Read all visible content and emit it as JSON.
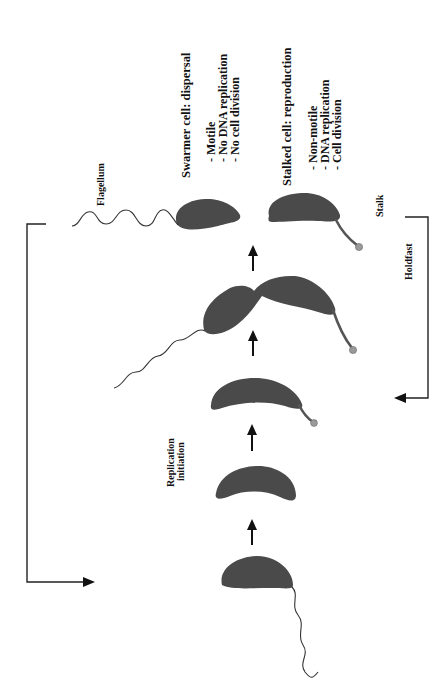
{
  "figure": {
    "orientation": "rotated 90 degrees counter-clockwise"
  },
  "labels": {
    "swarmer_title": "Swarmer cell: dispersal",
    "swarmer_items": [
      "- Motile",
      "- No DNA replication",
      "- No cell division"
    ],
    "stalked_title": "Stalked cell: reproduction",
    "stalked_items": [
      "- Non-motile",
      "- DNA replication",
      "- Cell division"
    ],
    "flagellum": "Flagellum",
    "stalk": "Stalk",
    "holdfast": "Holdfast",
    "replication_line1": "Replication",
    "replication_line2": "initiation"
  },
  "stages": [
    {
      "name": "swarmer cell",
      "features": [
        "flagellum"
      ]
    },
    {
      "name": "stalked cell (replication initiation)",
      "features": []
    },
    {
      "name": "stalked cell",
      "features": [
        "stalk",
        "holdfast"
      ]
    },
    {
      "name": "predivisional cell",
      "features": [
        "flagellum",
        "stalk",
        "holdfast"
      ]
    },
    {
      "name": "daughter swarmer cell",
      "features": [
        "flagellum"
      ]
    },
    {
      "name": "daughter stalked cell",
      "features": [
        "stalk",
        "holdfast"
      ]
    }
  ],
  "colors": {
    "cell_fill": "#4a4a4a",
    "line": "#222222",
    "background": "#ffffff"
  }
}
